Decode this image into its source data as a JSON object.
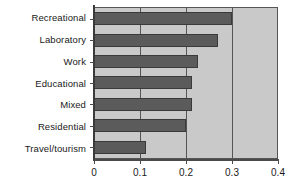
{
  "chart_data": {
    "type": "bar",
    "orientation": "horizontal",
    "title": "",
    "xlabel": "",
    "ylabel": "",
    "categories": [
      "Recreational",
      "Laboratory",
      "Work",
      "Educational",
      "Mixed",
      "Residential",
      "Travel/tourism"
    ],
    "values": [
      0.3,
      0.27,
      0.225,
      0.212,
      0.212,
      0.2,
      0.112
    ],
    "xlim": [
      0,
      0.4
    ],
    "xticks": [
      0,
      0.1,
      0.2,
      0.3,
      0.4
    ],
    "xtick_labels": [
      "0",
      "0.1",
      "0.2",
      "0.3",
      "0.4"
    ],
    "grid": true,
    "grid_axis": "x",
    "legend": "none",
    "colors": {
      "bar_fill": "#5b5b5b",
      "bar_edge": "#3a3a3a",
      "plot_background": "#c9c9c9",
      "axis": "#4a4a4a",
      "gridline": "#555555",
      "text": "#1a1a1a",
      "figure_background": "#ffffff"
    }
  }
}
